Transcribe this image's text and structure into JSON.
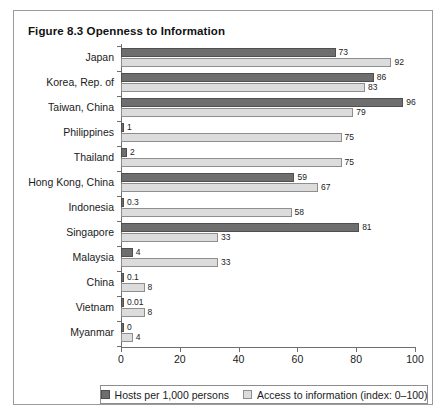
{
  "figure": {
    "title": "Figure 8.3  Openness to Information",
    "source_note": ""
  },
  "legend": {
    "position": "bottom",
    "items": [
      {
        "label": "Hosts per 1,000 persons",
        "swatch": "dark-gray-swatch",
        "color": "#6e6e6e"
      },
      {
        "label": "Access to information (index: 0–100)",
        "swatch": "light-gray-swatch",
        "color": "#dcdcdc"
      }
    ]
  },
  "chart_data": {
    "type": "bar",
    "orientation": "horizontal",
    "title": "Figure 8.3  Openness to Information",
    "xlabel": "",
    "ylabel": "",
    "xlim": [
      0,
      100
    ],
    "xticks": [
      0,
      20,
      40,
      60,
      80,
      100
    ],
    "xtick_labels": [
      "0",
      "20",
      "40",
      "60",
      "80",
      "100"
    ],
    "grid": false,
    "legend_position": "bottom",
    "categories": [
      "Japan",
      "Korea, Rep. of",
      "Taiwan, China",
      "Philippines",
      "Thailand",
      "Hong Kong, China",
      "Indonesia",
      "Singapore",
      "Malaysia",
      "China",
      "Vietnam",
      "Myanmar"
    ],
    "series": [
      {
        "name": "Hosts per 1,000 persons",
        "color": "#6e6e6e",
        "values": [
          73,
          86,
          96,
          1,
          2,
          59,
          0.3,
          81,
          4,
          0.1,
          0.01,
          0
        ],
        "value_labels": [
          "73",
          "86",
          "96",
          "1",
          "2",
          "59",
          "0.3",
          "81",
          "4",
          "0.1",
          "0.01",
          "0"
        ]
      },
      {
        "name": "Access to information (index: 0–100)",
        "color": "#dcdcdc",
        "values": [
          92,
          83,
          79,
          75,
          75,
          67,
          58,
          33,
          33,
          8,
          8,
          4
        ],
        "value_labels": [
          "92",
          "83",
          "79",
          "75",
          "75",
          "67",
          "58",
          "33",
          "33",
          "8",
          "8",
          "4"
        ]
      }
    ]
  }
}
